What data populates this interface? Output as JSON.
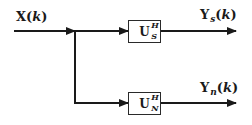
{
  "diagram": {
    "input": {
      "symbol": "X",
      "arg_open": "(",
      "arg_var": "k",
      "arg_close": ")"
    },
    "blocks": [
      {
        "id": "signal-subspace-projector",
        "symbol": "U",
        "superscript": "H",
        "subscript": "S"
      },
      {
        "id": "noise-subspace-projector",
        "symbol": "U",
        "superscript": "H",
        "subscript": "N"
      }
    ],
    "outputs": [
      {
        "symbol": "Y",
        "subscript": "s",
        "arg_open": "(",
        "arg_var": "k",
        "arg_close": ")"
      },
      {
        "symbol": "Y",
        "subscript": "n",
        "arg_open": "(",
        "arg_var": "k",
        "arg_close": ")"
      }
    ],
    "colors": {
      "line": "#1a1a1a",
      "background": "#ffffff"
    }
  }
}
